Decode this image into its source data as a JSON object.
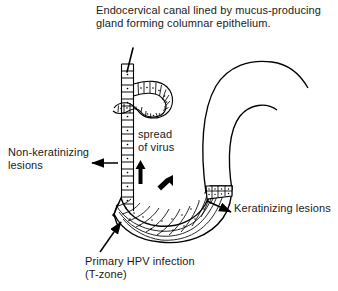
{
  "diagram": {
    "title_caption": "Endocervical canal lined by mucus-producing gland forming columnar epithelium.",
    "labels": {
      "non_keratinizing": "Non-keratinizing\nlesions",
      "spread_of_virus": "spread\nof virus",
      "keratinizing": "Keratinizing lesions",
      "primary_hpv": "Primary HPV infection\n(T-zone)"
    },
    "colors": {
      "ink": "#000000",
      "text": "#1a1a1a",
      "background": "#ffffff"
    },
    "icons": {
      "leader_line": "leader-line-icon",
      "arrow_left": "arrow-left-icon",
      "arrow_up_bold": "arrow-up-bold-icon",
      "arrow_diagonal_bold": "arrow-diagonal-bold-icon",
      "arrow_right": "arrow-right-icon",
      "arrow_diagonal_up": "arrow-diagonal-up-icon",
      "brace": "curly-brace-icon"
    },
    "structures": {
      "columnar_epithelium": "columnar-epithelium-canal",
      "mucus_gland": "mucus-producing-gland-loop",
      "squamous_epithelium": "keratinizing-squamous-epithelium",
      "cervix_outline": "cervix-outer-contour"
    }
  }
}
